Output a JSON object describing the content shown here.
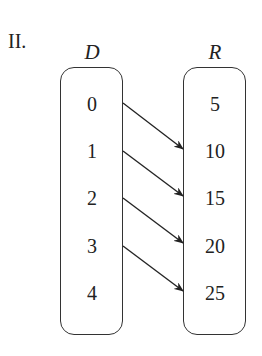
{
  "problem_label": "II.",
  "domain_set": {
    "label": "D",
    "values": [
      "0",
      "1",
      "2",
      "3",
      "4"
    ]
  },
  "range_set": {
    "label": "R",
    "values": [
      "5",
      "10",
      "15",
      "20",
      "25"
    ]
  },
  "mappings": [
    {
      "from": "0",
      "to": "10"
    },
    {
      "from": "1",
      "to": "15"
    },
    {
      "from": "2",
      "to": "20"
    },
    {
      "from": "3",
      "to": "25"
    }
  ]
}
